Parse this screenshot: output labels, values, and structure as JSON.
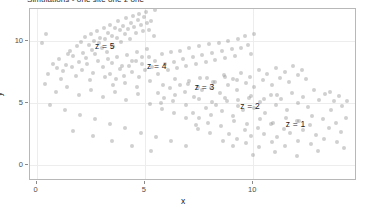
{
  "figure": {
    "title": "Simulations - one site one z one",
    "background": "#ffffff",
    "point_color": "#8e8e8e",
    "axis_color": "#8a8a8a",
    "panel_border": "#b8b8b8",
    "grid_color": "#ededed"
  },
  "chart_data": {
    "type": "scatter",
    "title": "Simulations - one site one z one",
    "xlabel": "x",
    "ylabel": "y",
    "xlim": [
      -0.3,
      14.7
    ],
    "ylim": [
      -1.1,
      12.6
    ],
    "xticks": [
      0,
      5,
      10
    ],
    "yticks": [
      0,
      5,
      10
    ],
    "xticklabels": [
      "0",
      "5",
      "10"
    ],
    "yticklabels": [
      "0",
      "5",
      "10"
    ],
    "grid": true,
    "legend": "none",
    "marker": {
      "shape": "circle",
      "size": 4,
      "alpha": 0.42
    },
    "annotations": [
      {
        "text": "z = 5",
        "x": 2.7,
        "y": 9.6
      },
      {
        "text": "z = 4",
        "x": 5.1,
        "y": 8.0
      },
      {
        "text": "z = 3",
        "x": 7.3,
        "y": 6.3
      },
      {
        "text": "z = 2",
        "x": 9.4,
        "y": 4.8
      },
      {
        "text": "z = 1",
        "x": 11.5,
        "y": 3.3
      }
    ],
    "series": [
      {
        "name": "z = 5",
        "points": [
          [
            1.05,
            8.55
          ],
          [
            1.35,
            8.1
          ],
          [
            1.55,
            9.25
          ],
          [
            1.7,
            8.8
          ],
          [
            1.85,
            9.6
          ],
          [
            1.95,
            8.35
          ],
          [
            2.05,
            9.95
          ],
          [
            2.15,
            9.05
          ],
          [
            2.25,
            10.35
          ],
          [
            2.3,
            8.65
          ],
          [
            2.4,
            9.7
          ],
          [
            2.5,
            10.6
          ],
          [
            2.55,
            9.3
          ],
          [
            2.65,
            10.05
          ],
          [
            2.72,
            8.95
          ],
          [
            2.8,
            10.85
          ],
          [
            2.88,
            9.85
          ],
          [
            2.95,
            10.3
          ],
          [
            3.02,
            9.45
          ],
          [
            3.1,
            11.05
          ],
          [
            3.18,
            10.15
          ],
          [
            3.25,
            9.1
          ],
          [
            3.32,
            10.7
          ],
          [
            3.4,
            11.35
          ],
          [
            3.48,
            10.45
          ],
          [
            3.55,
            9.65
          ],
          [
            3.62,
            11.1
          ],
          [
            3.7,
            10.25
          ],
          [
            3.78,
            11.6
          ],
          [
            3.85,
            10.9
          ],
          [
            3.92,
            9.95
          ],
          [
            4.0,
            11.25
          ],
          [
            4.08,
            10.55
          ],
          [
            4.15,
            11.85
          ],
          [
            4.22,
            11.0
          ],
          [
            4.3,
            10.2
          ],
          [
            4.38,
            11.45
          ],
          [
            4.45,
            12.05
          ],
          [
            4.52,
            11.15
          ],
          [
            4.6,
            10.65
          ],
          [
            4.68,
            11.7
          ],
          [
            4.75,
            12.2
          ],
          [
            4.82,
            11.3
          ],
          [
            4.9,
            10.85
          ],
          [
            4.98,
            11.95
          ],
          [
            5.05,
            12.35
          ],
          [
            5.12,
            11.5
          ],
          [
            5.2,
            10.95
          ],
          [
            0.75,
            8.2
          ],
          [
            0.95,
            7.85
          ],
          [
            1.2,
            7.6
          ],
          [
            1.45,
            8.95
          ],
          [
            1.62,
            7.95
          ],
          [
            2.1,
            7.7
          ],
          [
            2.35,
            8.15
          ],
          [
            2.6,
            7.45
          ],
          [
            2.85,
            8.4
          ],
          [
            3.05,
            7.9
          ],
          [
            3.28,
            8.55
          ],
          [
            3.5,
            8.25
          ],
          [
            3.72,
            8.7
          ],
          [
            3.95,
            8.05
          ],
          [
            4.18,
            8.9
          ],
          [
            4.42,
            8.45
          ],
          [
            4.65,
            9.15
          ],
          [
            4.88,
            8.7
          ],
          [
            5.1,
            9.4
          ],
          [
            5.3,
            11.6
          ],
          [
            5.4,
            10.4
          ],
          [
            5.45,
            12.55
          ],
          [
            0.55,
            7.35
          ],
          [
            1.15,
            6.95
          ],
          [
            1.8,
            7.2
          ],
          [
            2.45,
            6.85
          ],
          [
            3.15,
            7.15
          ]
        ]
      },
      {
        "name": "z = 4",
        "points": [
          [
            3.4,
            7.35
          ],
          [
            3.65,
            6.95
          ],
          [
            3.85,
            7.8
          ],
          [
            4.05,
            7.2
          ],
          [
            4.25,
            8.05
          ],
          [
            4.4,
            7.55
          ],
          [
            4.58,
            8.45
          ],
          [
            4.72,
            7.1
          ],
          [
            4.88,
            8.2
          ],
          [
            5.02,
            7.65
          ],
          [
            5.18,
            8.75
          ],
          [
            5.32,
            7.95
          ],
          [
            5.48,
            8.4
          ],
          [
            5.62,
            7.35
          ],
          [
            5.78,
            8.95
          ],
          [
            5.92,
            8.15
          ],
          [
            6.05,
            7.7
          ],
          [
            6.2,
            9.1
          ],
          [
            6.35,
            8.35
          ],
          [
            6.48,
            7.85
          ],
          [
            6.62,
            9.25
          ],
          [
            6.78,
            8.55
          ],
          [
            6.92,
            8.0
          ],
          [
            7.05,
            9.45
          ],
          [
            7.2,
            8.7
          ],
          [
            7.35,
            8.2
          ],
          [
            7.5,
            9.6
          ],
          [
            7.65,
            8.9
          ],
          [
            7.8,
            8.35
          ],
          [
            7.95,
            9.75
          ],
          [
            8.1,
            9.05
          ],
          [
            8.25,
            8.5
          ],
          [
            8.4,
            9.9
          ],
          [
            8.55,
            9.2
          ],
          [
            8.7,
            8.65
          ],
          [
            8.85,
            10.05
          ],
          [
            9.0,
            9.35
          ],
          [
            9.15,
            8.8
          ],
          [
            9.3,
            10.2
          ],
          [
            9.45,
            9.5
          ],
          [
            3.55,
            6.45
          ],
          [
            4.1,
            6.65
          ],
          [
            4.65,
            6.3
          ],
          [
            5.25,
            6.8
          ],
          [
            5.85,
            6.5
          ],
          [
            6.4,
            6.95
          ],
          [
            7.0,
            6.6
          ],
          [
            7.55,
            7.05
          ],
          [
            8.15,
            6.75
          ],
          [
            8.7,
            7.15
          ],
          [
            9.25,
            6.85
          ],
          [
            9.6,
            10.4
          ],
          [
            9.75,
            9.7
          ],
          [
            9.9,
            8.95
          ],
          [
            10.05,
            10.55
          ]
        ]
      },
      {
        "name": "z = 3",
        "points": [
          [
            5.6,
            5.85
          ],
          [
            5.9,
            5.45
          ],
          [
            6.15,
            6.25
          ],
          [
            6.4,
            5.7
          ],
          [
            6.62,
            6.5
          ],
          [
            6.85,
            5.95
          ],
          [
            7.05,
            6.8
          ],
          [
            7.25,
            5.55
          ],
          [
            7.45,
            6.35
          ],
          [
            7.65,
            6.05
          ],
          [
            7.85,
            7.05
          ],
          [
            8.05,
            6.25
          ],
          [
            8.25,
            6.7
          ],
          [
            8.45,
            5.8
          ],
          [
            8.65,
            7.25
          ],
          [
            8.85,
            6.45
          ],
          [
            9.05,
            6.95
          ],
          [
            9.25,
            6.05
          ],
          [
            9.45,
            7.45
          ],
          [
            9.65,
            6.65
          ],
          [
            9.85,
            7.15
          ],
          [
            10.05,
            6.3
          ],
          [
            10.25,
            7.65
          ],
          [
            10.45,
            6.85
          ],
          [
            10.65,
            7.35
          ],
          [
            10.85,
            6.5
          ],
          [
            11.05,
            7.85
          ],
          [
            11.25,
            7.05
          ],
          [
            11.45,
            7.5
          ],
          [
            11.65,
            6.7
          ],
          [
            5.75,
            5.05
          ],
          [
            6.3,
            5.2
          ],
          [
            6.9,
            4.9
          ],
          [
            7.5,
            5.35
          ],
          [
            8.1,
            5.1
          ],
          [
            8.7,
            5.45
          ],
          [
            9.3,
            5.25
          ],
          [
            9.9,
            5.6
          ],
          [
            10.5,
            5.35
          ],
          [
            11.1,
            5.7
          ],
          [
            11.85,
            8.0
          ],
          [
            12.05,
            7.25
          ],
          [
            12.25,
            7.7
          ],
          [
            12.45,
            6.95
          ]
        ]
      },
      {
        "name": "z = 2",
        "points": [
          [
            7.2,
            4.25
          ],
          [
            7.5,
            3.85
          ],
          [
            7.8,
            4.65
          ],
          [
            8.05,
            4.1
          ],
          [
            8.3,
            4.9
          ],
          [
            8.55,
            4.35
          ],
          [
            8.8,
            5.2
          ],
          [
            9.05,
            3.95
          ],
          [
            9.3,
            4.75
          ],
          [
            9.55,
            4.45
          ],
          [
            9.8,
            5.45
          ],
          [
            10.05,
            4.65
          ],
          [
            10.3,
            5.1
          ],
          [
            10.55,
            4.2
          ],
          [
            10.8,
            5.65
          ],
          [
            11.05,
            4.85
          ],
          [
            11.3,
            5.35
          ],
          [
            11.55,
            4.45
          ],
          [
            11.8,
            5.85
          ],
          [
            12.05,
            5.05
          ],
          [
            12.3,
            5.55
          ],
          [
            12.55,
            4.7
          ],
          [
            12.8,
            6.05
          ],
          [
            13.05,
            5.25
          ],
          [
            13.3,
            5.75
          ],
          [
            7.35,
            3.25
          ],
          [
            7.9,
            3.45
          ],
          [
            8.5,
            3.15
          ],
          [
            9.1,
            3.6
          ],
          [
            9.7,
            3.35
          ],
          [
            10.3,
            3.7
          ],
          [
            10.9,
            3.45
          ],
          [
            11.5,
            3.85
          ],
          [
            12.1,
            3.55
          ],
          [
            12.7,
            3.95
          ],
          [
            13.55,
            5.95
          ],
          [
            13.75,
            5.2
          ],
          [
            13.95,
            5.6
          ]
        ]
      },
      {
        "name": "z = 1",
        "points": [
          [
            8.9,
            2.55
          ],
          [
            9.25,
            2.15
          ],
          [
            9.6,
            2.85
          ],
          [
            9.9,
            2.35
          ],
          [
            10.2,
            3.05
          ],
          [
            10.5,
            2.55
          ],
          [
            10.8,
            3.35
          ],
          [
            11.1,
            2.25
          ],
          [
            11.4,
            2.95
          ],
          [
            11.7,
            2.65
          ],
          [
            12.0,
            3.55
          ],
          [
            12.3,
            2.85
          ],
          [
            12.6,
            3.25
          ],
          [
            12.9,
            2.45
          ],
          [
            13.2,
            3.75
          ],
          [
            13.5,
            3.05
          ],
          [
            13.8,
            3.45
          ],
          [
            14.05,
            2.7
          ],
          [
            14.3,
            3.85
          ],
          [
            9.05,
            1.55
          ],
          [
            9.65,
            1.8
          ],
          [
            10.25,
            1.45
          ],
          [
            10.85,
            1.9
          ],
          [
            11.45,
            1.6
          ],
          [
            12.05,
            2.0
          ],
          [
            12.65,
            1.7
          ],
          [
            13.25,
            2.1
          ],
          [
            13.85,
            1.85
          ],
          [
            10.0,
            0.85
          ],
          [
            11.0,
            1.05
          ],
          [
            12.0,
            0.75
          ],
          [
            13.0,
            1.15
          ],
          [
            8.6,
            1.95
          ],
          [
            14.2,
            1.4
          ]
        ]
      },
      {
        "name": "scatter",
        "points": [
          [
            0.4,
            6.55
          ],
          [
            0.9,
            5.95
          ],
          [
            1.4,
            6.35
          ],
          [
            1.95,
            5.7
          ],
          [
            2.5,
            6.1
          ],
          [
            3.05,
            5.5
          ],
          [
            3.6,
            5.9
          ],
          [
            4.15,
            5.3
          ],
          [
            4.7,
            5.75
          ],
          [
            5.25,
            4.95
          ],
          [
            5.8,
            4.55
          ],
          [
            6.35,
            4.2
          ],
          [
            6.9,
            3.85
          ],
          [
            7.45,
            2.95
          ],
          [
            8.0,
            2.6
          ],
          [
            0.6,
            4.85
          ],
          [
            1.3,
            4.45
          ],
          [
            2.0,
            4.05
          ],
          [
            2.7,
            3.7
          ],
          [
            3.4,
            3.35
          ],
          [
            4.1,
            3.0
          ],
          [
            4.8,
            2.65
          ],
          [
            5.5,
            2.3
          ],
          [
            6.2,
            1.95
          ],
          [
            6.9,
            1.6
          ],
          [
            1.7,
            2.75
          ],
          [
            2.6,
            2.35
          ],
          [
            3.5,
            1.95
          ],
          [
            4.4,
            1.55
          ],
          [
            5.3,
            1.15
          ],
          [
            13.6,
            4.45
          ],
          [
            14.1,
            4.75
          ],
          [
            14.35,
            5.15
          ],
          [
            0.25,
            9.85
          ],
          [
            0.45,
            10.55
          ]
        ]
      }
    ]
  },
  "axes": {
    "x_title": "x",
    "y_title": "y"
  }
}
